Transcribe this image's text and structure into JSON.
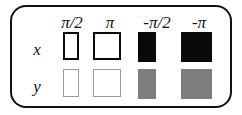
{
  "legend": {
    "name": "phase-legend",
    "panel_border_color": "#111111",
    "background_color": "#ffffff",
    "columns": [
      {
        "id": "col-pi-over-2",
        "label": "π/2",
        "sign": "",
        "symbol": "π",
        "suffix": "/2"
      },
      {
        "id": "col-pi",
        "label": "π",
        "sign": "",
        "symbol": "π",
        "suffix": ""
      },
      {
        "id": "col-neg-pi-over-2",
        "label": "-π/2",
        "sign": "-",
        "symbol": "π",
        "suffix": "/2"
      },
      {
        "id": "col-neg-pi",
        "label": "-π",
        "sign": "-",
        "symbol": "π",
        "suffix": ""
      }
    ],
    "rows": [
      {
        "id": "row-x",
        "label": "x",
        "swatches": [
          {
            "column": "π/2",
            "style": "white-heavy-border",
            "fill": "#ffffff",
            "border": "#0a0a0a"
          },
          {
            "column": "π",
            "style": "white-heavy-border",
            "fill": "#ffffff",
            "border": "#0a0a0a"
          },
          {
            "column": "-π/2",
            "style": "solid-black",
            "fill": "#090909",
            "border": "none"
          },
          {
            "column": "-π",
            "style": "solid-black",
            "fill": "#090909",
            "border": "none"
          }
        ]
      },
      {
        "id": "row-y",
        "label": "y",
        "swatches": [
          {
            "column": "π/2",
            "style": "white-light-border",
            "fill": "#ffffff",
            "border": "#9a9a9a"
          },
          {
            "column": "π",
            "style": "white-light-border",
            "fill": "#ffffff",
            "border": "#9a9a9a"
          },
          {
            "column": "-π/2",
            "style": "solid-gray",
            "fill": "#7d7d7d",
            "border": "none"
          },
          {
            "column": "-π",
            "style": "solid-gray",
            "fill": "#7d7d7d",
            "border": "none"
          }
        ]
      }
    ]
  }
}
